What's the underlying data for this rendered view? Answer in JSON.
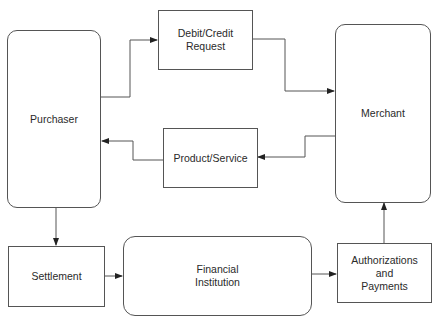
{
  "diagram": {
    "type": "flowchart",
    "nodes": {
      "purchaser": {
        "label": "Purchaser",
        "shape": "rounded-rect"
      },
      "debit_credit": {
        "label": "Debit/Credit\nRequest",
        "shape": "rect"
      },
      "merchant": {
        "label": "Merchant",
        "shape": "rounded-rect"
      },
      "product_service": {
        "label": "Product/Service",
        "shape": "rect"
      },
      "settlement": {
        "label": "Settlement",
        "shape": "rect"
      },
      "financial_institution": {
        "label": "Financial\nInstitution",
        "shape": "rounded-rect"
      },
      "authorizations": {
        "label": "Authorizations\nand\nPayments",
        "shape": "rect"
      }
    },
    "edges": [
      {
        "from": "Purchaser",
        "to": "Debit/Credit Request"
      },
      {
        "from": "Debit/Credit Request",
        "to": "Merchant"
      },
      {
        "from": "Merchant",
        "to": "Product/Service"
      },
      {
        "from": "Product/Service",
        "to": "Purchaser"
      },
      {
        "from": "Purchaser",
        "to": "Settlement"
      },
      {
        "from": "Settlement",
        "to": "Financial Institution"
      },
      {
        "from": "Financial Institution",
        "to": "Authorizations and Payments"
      },
      {
        "from": "Authorizations and Payments",
        "to": "Merchant"
      }
    ],
    "colors": {
      "line": "#555555",
      "text": "#2a2a2a",
      "background": "#ffffff"
    }
  }
}
